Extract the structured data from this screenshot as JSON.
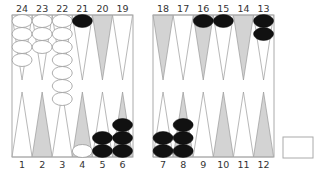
{
  "game": "backgammon",
  "colors": {
    "board_bg": "#ffffff",
    "border": "#aaaaaa",
    "point_light": "#ffffff",
    "point_dark": "#d3d3d3",
    "point_stroke": "#999999",
    "white_checker": "#ffffff",
    "white_checker_stroke": "#999999",
    "black_checker": "#111111"
  },
  "top_labels": [
    "24",
    "23",
    "22",
    "21",
    "20",
    "19",
    "18",
    "17",
    "16",
    "15",
    "14",
    "13"
  ],
  "bottom_labels": [
    "1",
    "2",
    "3",
    "4",
    "5",
    "6",
    "7",
    "8",
    "9",
    "10",
    "11",
    "12"
  ],
  "positions": [
    {
      "point": 24,
      "color": "white",
      "count": 4
    },
    {
      "point": 23,
      "color": "white",
      "count": 3
    },
    {
      "point": 22,
      "color": "white",
      "count": 7
    },
    {
      "point": 21,
      "color": "black",
      "count": 1
    },
    {
      "point": 16,
      "color": "black",
      "count": 1
    },
    {
      "point": 15,
      "color": "black",
      "count": 1
    },
    {
      "point": 13,
      "color": "black",
      "count": 2
    },
    {
      "point": 4,
      "color": "white",
      "count": 1
    },
    {
      "point": 5,
      "color": "black",
      "count": 2
    },
    {
      "point": 6,
      "color": "black",
      "count": 3
    },
    {
      "point": 7,
      "color": "black",
      "count": 2
    },
    {
      "point": 8,
      "color": "black",
      "count": 3
    }
  ],
  "shaded_points": [
    20,
    18,
    16,
    14,
    2,
    4,
    6,
    8,
    10,
    12
  ],
  "side_box": {
    "label": ""
  }
}
